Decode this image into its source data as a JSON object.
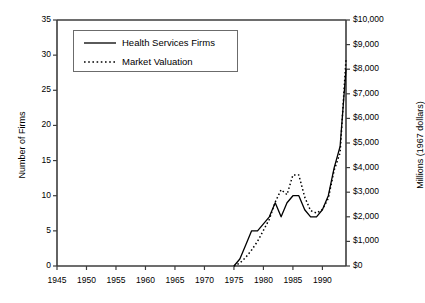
{
  "chart_data": {
    "type": "line",
    "title": "",
    "subtitle": "",
    "xlabel": "",
    "ylabel": "Number of Firms",
    "ylabel_right": "Millions (1967 dollars)",
    "xlim": [
      1945,
      1994
    ],
    "ylim": [
      0,
      35
    ],
    "ylim_right": [
      0,
      10000
    ],
    "grid": false,
    "legend_position": "upper-left",
    "x_ticks": [
      "1945",
      "1950",
      "1955",
      "1960",
      "1965",
      "1970",
      "1975",
      "1980",
      "1985",
      "1990"
    ],
    "x_tick_values": [
      1945,
      1950,
      1955,
      1960,
      1965,
      1970,
      1975,
      1980,
      1985,
      1990
    ],
    "y_ticks_left": [
      "0",
      "5",
      "10",
      "15",
      "20",
      "25",
      "30",
      "35"
    ],
    "y_tick_values_left": [
      0,
      5,
      10,
      15,
      20,
      25,
      30,
      35
    ],
    "y_ticks_right": [
      "$0",
      "$1,000",
      "$2,000",
      "$3,000",
      "$4,000",
      "$5,000",
      "$6,000",
      "$7,000",
      "$8,000",
      "$9,000",
      "$10,000"
    ],
    "y_tick_values_right": [
      0,
      1000,
      2000,
      3000,
      4000,
      5000,
      6000,
      7000,
      8000,
      9000,
      10000
    ],
    "x": [
      1975,
      1976,
      1977,
      1978,
      1979,
      1980,
      1981,
      1982,
      1983,
      1984,
      1985,
      1986,
      1987,
      1988,
      1989,
      1990,
      1991,
      1992,
      1993,
      1994
    ],
    "series": [
      {
        "name": "Health Services Firms",
        "axis": "left",
        "style": "solid",
        "color": "#000000",
        "values": [
          0,
          1,
          3,
          5,
          5,
          6,
          7,
          9,
          7,
          9,
          10,
          10,
          8,
          7,
          7,
          8,
          10,
          14,
          17,
          28
        ]
      },
      {
        "name": "Market Valuation",
        "axis": "right",
        "style": "dotted",
        "color": "#000000",
        "values": [
          0,
          120,
          350,
          650,
          1000,
          1450,
          1900,
          2600,
          3100,
          2900,
          3700,
          3700,
          2800,
          2250,
          2150,
          2300,
          2750,
          3900,
          4600,
          8400
        ]
      }
    ]
  },
  "legend": {
    "items": [
      {
        "label": "Health Services Firms",
        "style": "solid"
      },
      {
        "label": "Market Valuation",
        "style": "dotted"
      }
    ]
  }
}
